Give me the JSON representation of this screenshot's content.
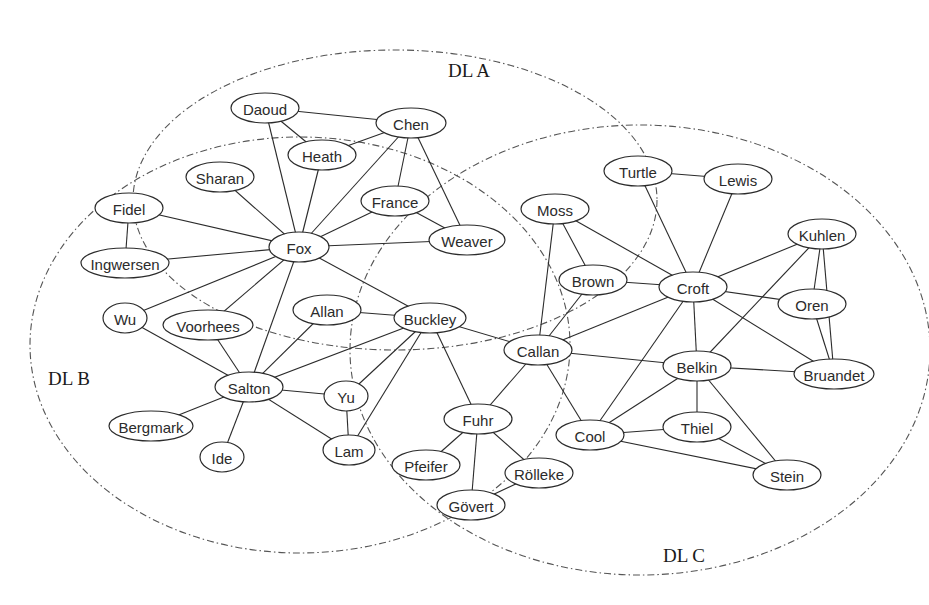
{
  "regions": [
    {
      "id": "dl-a",
      "label": "DL A",
      "cx": 395,
      "cy": 200,
      "rx": 262,
      "ry": 150,
      "label_x": 448,
      "label_y": 77
    },
    {
      "id": "dl-b",
      "label": "DL B",
      "cx": 300,
      "cy": 345,
      "rx": 270,
      "ry": 208,
      "label_x": 48,
      "label_y": 385
    },
    {
      "id": "dl-c",
      "label": "DL C",
      "cx": 640,
      "cy": 350,
      "rx": 290,
      "ry": 225,
      "label_x": 663,
      "label_y": 562
    }
  ],
  "nodes": [
    {
      "id": "daoud",
      "label": "Daoud",
      "x": 265,
      "y": 108,
      "rx": 34,
      "ry": 15
    },
    {
      "id": "chen",
      "label": "Chen",
      "x": 411,
      "y": 123,
      "rx": 35,
      "ry": 15
    },
    {
      "id": "heath",
      "label": "Heath",
      "x": 322,
      "y": 155,
      "rx": 34,
      "ry": 15
    },
    {
      "id": "sharan",
      "label": "Sharan",
      "x": 220,
      "y": 177,
      "rx": 34,
      "ry": 15
    },
    {
      "id": "fidel",
      "label": "Fidel",
      "x": 129,
      "y": 208,
      "rx": 34,
      "ry": 15
    },
    {
      "id": "france",
      "label": "France",
      "x": 395,
      "y": 201,
      "rx": 34,
      "ry": 15
    },
    {
      "id": "fox",
      "label": "Fox",
      "x": 299,
      "y": 247,
      "rx": 30,
      "ry": 15
    },
    {
      "id": "weaver",
      "label": "Weaver",
      "x": 467,
      "y": 240,
      "rx": 38,
      "ry": 15
    },
    {
      "id": "ingwersen",
      "label": "Ingwersen",
      "x": 125,
      "y": 263,
      "rx": 44,
      "ry": 15
    },
    {
      "id": "wu",
      "label": "Wu",
      "x": 125,
      "y": 318,
      "rx": 22,
      "ry": 15
    },
    {
      "id": "voorhees",
      "label": "Voorhees",
      "x": 208,
      "y": 325,
      "rx": 45,
      "ry": 15
    },
    {
      "id": "allan",
      "label": "Allan",
      "x": 327,
      "y": 310,
      "rx": 34,
      "ry": 15
    },
    {
      "id": "buckley",
      "label": "Buckley",
      "x": 430,
      "y": 318,
      "rx": 36,
      "ry": 15
    },
    {
      "id": "salton",
      "label": "Salton",
      "x": 249,
      "y": 387,
      "rx": 34,
      "ry": 15
    },
    {
      "id": "yu",
      "label": "Yu",
      "x": 346,
      "y": 396,
      "rx": 22,
      "ry": 15
    },
    {
      "id": "bergmark",
      "label": "Bergmark",
      "x": 151,
      "y": 426,
      "rx": 42,
      "ry": 15
    },
    {
      "id": "ide",
      "label": "Ide",
      "x": 222,
      "y": 457,
      "rx": 22,
      "ry": 15
    },
    {
      "id": "lam",
      "label": "Lam",
      "x": 349,
      "y": 450,
      "rx": 26,
      "ry": 15
    },
    {
      "id": "turtle",
      "label": "Turtle",
      "x": 638,
      "y": 171,
      "rx": 34,
      "ry": 15
    },
    {
      "id": "lewis",
      "label": "Lewis",
      "x": 738,
      "y": 179,
      "rx": 34,
      "ry": 15
    },
    {
      "id": "moss",
      "label": "Moss",
      "x": 555,
      "y": 209,
      "rx": 34,
      "ry": 15
    },
    {
      "id": "brown",
      "label": "Brown",
      "x": 593,
      "y": 280,
      "rx": 34,
      "ry": 15
    },
    {
      "id": "croft",
      "label": "Croft",
      "x": 693,
      "y": 287,
      "rx": 34,
      "ry": 15
    },
    {
      "id": "kuhlen",
      "label": "Kuhlen",
      "x": 822,
      "y": 234,
      "rx": 34,
      "ry": 15
    },
    {
      "id": "oren",
      "label": "Oren",
      "x": 812,
      "y": 304,
      "rx": 34,
      "ry": 15
    },
    {
      "id": "callan",
      "label": "Callan",
      "x": 538,
      "y": 350,
      "rx": 34,
      "ry": 15
    },
    {
      "id": "belkin",
      "label": "Belkin",
      "x": 697,
      "y": 366,
      "rx": 34,
      "ry": 15
    },
    {
      "id": "bruandet",
      "label": "Bruandet",
      "x": 834,
      "y": 374,
      "rx": 40,
      "ry": 15
    },
    {
      "id": "fuhr",
      "label": "Fuhr",
      "x": 478,
      "y": 419,
      "rx": 34,
      "ry": 15
    },
    {
      "id": "cool",
      "label": "Cool",
      "x": 590,
      "y": 435,
      "rx": 34,
      "ry": 15
    },
    {
      "id": "thiel",
      "label": "Thiel",
      "x": 697,
      "y": 427,
      "rx": 34,
      "ry": 15
    },
    {
      "id": "stein",
      "label": "Stein",
      "x": 787,
      "y": 475,
      "rx": 34,
      "ry": 15
    },
    {
      "id": "pfeifer",
      "label": "Pfeifer",
      "x": 426,
      "y": 465,
      "rx": 34,
      "ry": 15
    },
    {
      "id": "rolleke",
      "label": "Rölleke",
      "x": 539,
      "y": 473,
      "rx": 34,
      "ry": 15
    },
    {
      "id": "govert",
      "label": "Gövert",
      "x": 471,
      "y": 505,
      "rx": 34,
      "ry": 15
    }
  ],
  "edges": [
    [
      "daoud",
      "chen"
    ],
    [
      "daoud",
      "heath"
    ],
    [
      "daoud",
      "fox"
    ],
    [
      "chen",
      "heath"
    ],
    [
      "chen",
      "fox"
    ],
    [
      "chen",
      "france"
    ],
    [
      "chen",
      "weaver"
    ],
    [
      "heath",
      "fox"
    ],
    [
      "sharan",
      "fox"
    ],
    [
      "fidel",
      "fox"
    ],
    [
      "fidel",
      "ingwersen"
    ],
    [
      "ingwersen",
      "fox"
    ],
    [
      "france",
      "fox"
    ],
    [
      "france",
      "weaver"
    ],
    [
      "weaver",
      "fox"
    ],
    [
      "fox",
      "wu"
    ],
    [
      "fox",
      "voorhees"
    ],
    [
      "fox",
      "salton"
    ],
    [
      "fox",
      "buckley"
    ],
    [
      "wu",
      "salton"
    ],
    [
      "voorhees",
      "salton"
    ],
    [
      "allan",
      "salton"
    ],
    [
      "allan",
      "buckley"
    ],
    [
      "salton",
      "buckley"
    ],
    [
      "salton",
      "yu"
    ],
    [
      "salton",
      "lam"
    ],
    [
      "salton",
      "bergmark"
    ],
    [
      "salton",
      "ide"
    ],
    [
      "yu",
      "buckley"
    ],
    [
      "yu",
      "lam"
    ],
    [
      "lam",
      "buckley"
    ],
    [
      "buckley",
      "callan"
    ],
    [
      "buckley",
      "fuhr"
    ],
    [
      "moss",
      "brown"
    ],
    [
      "moss",
      "callan"
    ],
    [
      "moss",
      "croft"
    ],
    [
      "brown",
      "croft"
    ],
    [
      "brown",
      "callan"
    ],
    [
      "turtle",
      "lewis"
    ],
    [
      "turtle",
      "croft"
    ],
    [
      "lewis",
      "croft"
    ],
    [
      "croft",
      "kuhlen"
    ],
    [
      "croft",
      "oren"
    ],
    [
      "croft",
      "callan"
    ],
    [
      "croft",
      "belkin"
    ],
    [
      "croft",
      "cool"
    ],
    [
      "croft",
      "bruandet"
    ],
    [
      "kuhlen",
      "oren"
    ],
    [
      "kuhlen",
      "belkin"
    ],
    [
      "kuhlen",
      "bruandet"
    ],
    [
      "oren",
      "bruandet"
    ],
    [
      "callan",
      "belkin"
    ],
    [
      "callan",
      "fuhr"
    ],
    [
      "callan",
      "cool"
    ],
    [
      "belkin",
      "bruandet"
    ],
    [
      "belkin",
      "cool"
    ],
    [
      "belkin",
      "thiel"
    ],
    [
      "belkin",
      "stein"
    ],
    [
      "cool",
      "thiel"
    ],
    [
      "cool",
      "stein"
    ],
    [
      "thiel",
      "stein"
    ],
    [
      "fuhr",
      "pfeifer"
    ],
    [
      "fuhr",
      "govert"
    ],
    [
      "fuhr",
      "rolleke"
    ],
    [
      "rolleke",
      "govert"
    ]
  ]
}
